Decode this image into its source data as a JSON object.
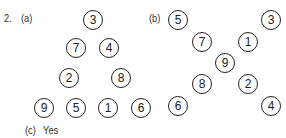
{
  "question": {
    "number": "2.",
    "part_a": "(a)",
    "part_b": "(b)",
    "part_c": "(c)",
    "answer_c": "Yes"
  },
  "triangle": [
    {
      "v": "3",
      "x": 93,
      "y": 20
    },
    {
      "v": "7",
      "x": 76,
      "y": 48
    },
    {
      "v": "4",
      "x": 109,
      "y": 48
    },
    {
      "v": "2",
      "x": 69,
      "y": 78
    },
    {
      "v": "8",
      "x": 121,
      "y": 78
    },
    {
      "v": "9",
      "x": 44,
      "y": 108
    },
    {
      "v": "5",
      "x": 76,
      "y": 108
    },
    {
      "v": "1",
      "x": 108,
      "y": 108
    },
    {
      "v": "6",
      "x": 141,
      "y": 108
    }
  ],
  "cross": [
    {
      "v": "5",
      "x": 178,
      "y": 20
    },
    {
      "v": "3",
      "x": 271,
      "y": 20
    },
    {
      "v": "7",
      "x": 202,
      "y": 42
    },
    {
      "v": "1",
      "x": 248,
      "y": 42
    },
    {
      "v": "9",
      "x": 225,
      "y": 63
    },
    {
      "v": "8",
      "x": 202,
      "y": 84
    },
    {
      "v": "2",
      "x": 248,
      "y": 84
    },
    {
      "v": "6",
      "x": 178,
      "y": 106
    },
    {
      "v": "4",
      "x": 271,
      "y": 106
    }
  ]
}
